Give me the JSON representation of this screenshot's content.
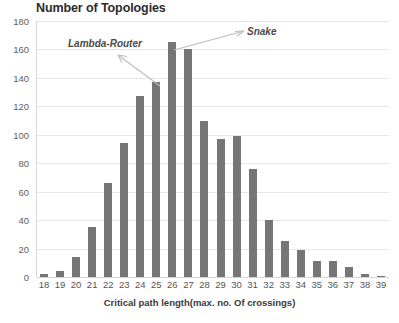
{
  "chart_data": {
    "type": "bar",
    "title": "Number of Topologies",
    "xlabel": "Critical path length(max. no. Of crossings)",
    "ylabel": "",
    "categories": [
      "18",
      "19",
      "20",
      "21",
      "22",
      "23",
      "24",
      "25",
      "26",
      "27",
      "28",
      "29",
      "30",
      "31",
      "32",
      "33",
      "34",
      "35",
      "36",
      "37",
      "38",
      "39"
    ],
    "values": [
      2,
      4,
      14,
      35,
      66,
      94,
      127,
      137,
      165,
      160,
      110,
      97,
      99,
      76,
      40,
      25,
      19,
      11,
      11,
      7,
      2,
      1
    ],
    "ylim": [
      0,
      180
    ],
    "ytick_labels": [
      "0",
      "20",
      "40",
      "60",
      "80",
      "100",
      "120",
      "140",
      "160",
      "180"
    ],
    "ytick_values": [
      0,
      20,
      40,
      60,
      80,
      100,
      120,
      140,
      160,
      180
    ],
    "grid": true,
    "legend": "none",
    "bar_color": "#767676",
    "gridline_color": "#e6e6e6",
    "annotations": [
      {
        "text": "Lambda-Router",
        "points_to_category": "25"
      },
      {
        "text": "Snake",
        "points_to_category": "27"
      }
    ]
  }
}
